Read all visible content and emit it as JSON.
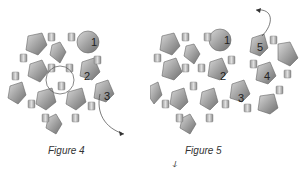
{
  "figures": [
    {
      "id": "figure-4",
      "caption": "Figure 4",
      "step_labels": [
        "1",
        "2",
        "3"
      ]
    },
    {
      "id": "figure-5",
      "caption": "Figure 5",
      "step_labels": [
        "1",
        "2",
        "3",
        "4",
        "5"
      ]
    }
  ],
  "stray_mark": "ↆ",
  "colors": {
    "bead_dark": "#7a7a7a",
    "bead_mid": "#a8a8a8",
    "bead_light": "#d6d6d6",
    "thread": "#555555",
    "background": "#ffffff"
  }
}
